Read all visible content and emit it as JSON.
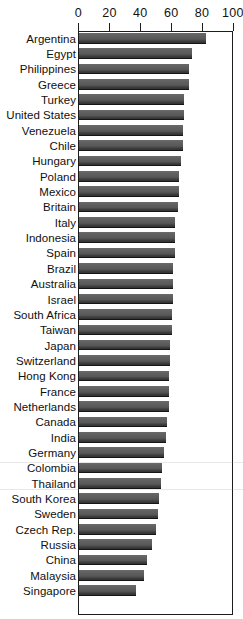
{
  "chart_data": {
    "type": "bar",
    "orientation": "horizontal",
    "title": "",
    "xlabel": "",
    "ylabel": "",
    "xlim": [
      0,
      100
    ],
    "grid": false,
    "legend": null,
    "axis_ticks": [
      0,
      20,
      40,
      60,
      80,
      100
    ],
    "tick_labels": [
      "0",
      "20",
      "40",
      "60",
      "80",
      "100"
    ],
    "categories": [
      "Argentina",
      "Egypt",
      "Philippines",
      "Greece",
      "Turkey",
      "United States",
      "Venezuela",
      "Chile",
      "Hungary",
      "Poland",
      "Mexico",
      "Britain",
      "Italy",
      "Indonesia",
      "Spain",
      "Brazil",
      "Australia",
      "Israel",
      "South Africa",
      "Taiwan",
      "Japan",
      "Switzerland",
      "Hong Kong",
      "France",
      "Netherlands",
      "Canada",
      "India",
      "Germany",
      "Colombia",
      "Thailand",
      "South Korea",
      "Sweden",
      "Czech Rep.",
      "Russia",
      "China",
      "Malaysia",
      "Singapore"
    ],
    "values": [
      82,
      73,
      71,
      71,
      68,
      68,
      67,
      67,
      66,
      65,
      65,
      64,
      62,
      62,
      62,
      61,
      61,
      61,
      60,
      60,
      59,
      59,
      58,
      58,
      58,
      57,
      56,
      55,
      54,
      53,
      52,
      51,
      50,
      47,
      44,
      42,
      37
    ],
    "bar_color": "#5c5c5c",
    "axis_color": "#1c1c1c",
    "background": "#ffffff"
  }
}
